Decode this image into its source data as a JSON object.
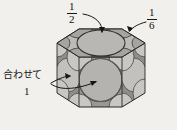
{
  "figure": {
    "title_alt": "hexagonal-prism-unit-cell-sphere-packing",
    "background_color": "#f2f0ec",
    "ink_color": "#1a1a1a",
    "face_fill_light": "#c9c7c3",
    "face_fill_mid": "#b0aeaa",
    "face_fill_dark": "#8d8b88",
    "sphere_fill": "#b9b7b3",
    "void_fill": "#5f5d5b"
  },
  "annotations": {
    "top_center": {
      "name": "fraction-one-half",
      "numerator": "1",
      "denominator": "2",
      "points_to": "top-face-center-sphere"
    },
    "top_right": {
      "name": "fraction-one-sixth",
      "numerator": "1",
      "denominator": "6",
      "points_to": "top-face-corner-sphere"
    },
    "left": {
      "name": "awasete-one",
      "text": "合わせて",
      "value": "1",
      "points_to": "side-face-sphere-and-center-sphere"
    }
  },
  "shape": {
    "kind": "hexagonal prism",
    "visible_side_faces": 3,
    "top_face": "hexagon",
    "corner_spheres": 6,
    "face_center_spheres": 3,
    "body_center_sphere": 1
  }
}
